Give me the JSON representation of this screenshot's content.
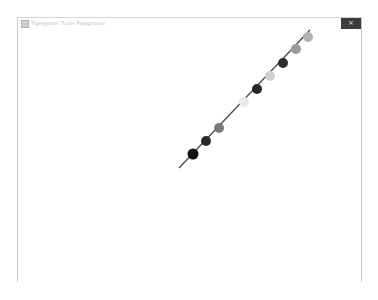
{
  "window": {
    "title": "TigerJython Turtle Playground",
    "close_label": "×"
  },
  "turtle_drawing": {
    "line_color": "#444444",
    "line_start": {
      "x": 179,
      "y": 168
    },
    "line_end": {
      "x": 310,
      "y": 30
    },
    "dots": [
      {
        "x": 193,
        "y": 154,
        "r": 5.5,
        "color": "#111111"
      },
      {
        "x": 206,
        "y": 141,
        "r": 5,
        "color": "#2a2a2a"
      },
      {
        "x": 219,
        "y": 128,
        "r": 5,
        "color": "#7a7a7a"
      },
      {
        "x": 244,
        "y": 102,
        "r": 5,
        "color": "#e8e8e8"
      },
      {
        "x": 257,
        "y": 89,
        "r": 5,
        "color": "#262626"
      },
      {
        "x": 270,
        "y": 76,
        "r": 5,
        "color": "#d0d0d0"
      },
      {
        "x": 283,
        "y": 63,
        "r": 5,
        "color": "#2e2e2e"
      },
      {
        "x": 296,
        "y": 49,
        "r": 5,
        "color": "#9a9a9a"
      },
      {
        "x": 308,
        "y": 37,
        "r": 5,
        "color": "#b4b4b4"
      }
    ]
  }
}
